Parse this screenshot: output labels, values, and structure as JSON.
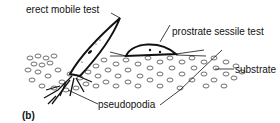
{
  "figure": {
    "panel_label": "(b)",
    "labels": {
      "erect_test": "erect mobile test",
      "prostrate_test": "prostrate sessile test",
      "substrate": "substrate",
      "pseudopodia": "pseudopodia"
    }
  },
  "colors": {
    "ink": "#111111",
    "background": "#ffffff"
  }
}
